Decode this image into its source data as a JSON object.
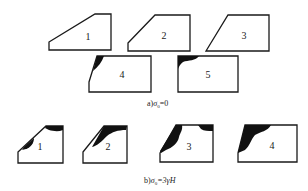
{
  "figure": {
    "panel_a": {
      "caption_prefix": "a)",
      "caption_symbol": "σ",
      "caption_subscript": "0",
      "caption_suffix": "=0",
      "shapes": [
        {
          "label": "1",
          "type": "slope-trapezoid",
          "plastic_zone": "none"
        },
        {
          "label": "2",
          "type": "slope-trapezoid",
          "plastic_zone": "none"
        },
        {
          "label": "3",
          "type": "slope-trapezoid",
          "plastic_zone": "none"
        },
        {
          "label": "4",
          "type": "steep-slope",
          "plastic_zone": "small at crest corner"
        },
        {
          "label": "5",
          "type": "vertical-cut",
          "plastic_zone": "small at top-left corner"
        }
      ]
    },
    "panel_b": {
      "caption_prefix": "b)",
      "caption_symbol": "σ",
      "caption_subscript": "0",
      "caption_suffix": "=3γH",
      "shapes": [
        {
          "label": "1",
          "type": "slope-trapezoid",
          "plastic_zone": "crest and mid-slope"
        },
        {
          "label": "2",
          "type": "slope-trapezoid",
          "plastic_zone": "crest band along slope"
        },
        {
          "label": "3",
          "type": "slope-trapezoid",
          "plastic_zone": "full slope face and crest"
        },
        {
          "label": "4",
          "type": "steep-slope",
          "plastic_zone": "large zone at slope face"
        }
      ]
    }
  }
}
